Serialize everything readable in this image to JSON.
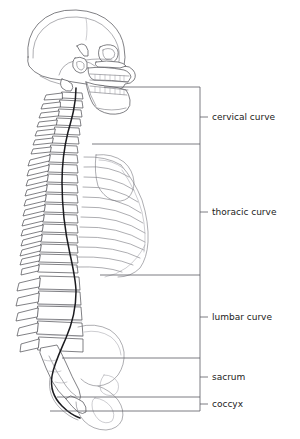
{
  "figure": {
    "background_color": "#ffffff",
    "line_color": "#4a4a50",
    "curve_color": "#1b1b1f",
    "label_color": "#222222",
    "bracket_color": "#5a5a62",
    "bracket_axis_x": 200,
    "tick_end_x": 208,
    "label_x": 212
  },
  "regions": [
    {
      "id": "cervical",
      "label": "cervical curve",
      "top_y": 87,
      "bottom_y": 144,
      "tick_y": 117,
      "divider_start_x": 104
    },
    {
      "id": "thoracic",
      "label": "thoracic curve",
      "top_y": 144,
      "bottom_y": 275,
      "tick_y": 212,
      "divider_start_x": 92
    },
    {
      "id": "lumbar",
      "label": "lumbar curve",
      "top_y": 275,
      "bottom_y": 358,
      "tick_y": 317,
      "divider_start_x": 62
    },
    {
      "id": "sacrum",
      "label": "sacrum",
      "top_y": 358,
      "bottom_y": 397,
      "tick_y": 377,
      "divider_start_x": 57
    },
    {
      "id": "coccyx",
      "label": "coccyx",
      "top_y": 397,
      "bottom_y": 411,
      "tick_y": 404,
      "divider_start_x": 50
    }
  ]
}
